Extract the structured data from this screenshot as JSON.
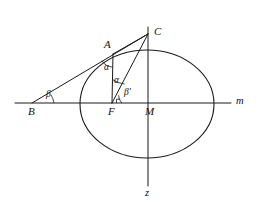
{
  "figure": {
    "width": 256,
    "height": 203,
    "background_color": "#ffffff",
    "stroke_color": "#1a1a1a"
  },
  "axes": [
    {
      "key": "m",
      "label": "m",
      "orientation": "horizontal",
      "label_x": 236,
      "label_y": 96,
      "x1": 15,
      "y1": 103,
      "x2": 231,
      "y2": 103
    },
    {
      "key": "z",
      "label": "z",
      "orientation": "vertical",
      "label_x": 145,
      "label_y": 188,
      "x1": 148,
      "y1": 27,
      "x2": 148,
      "y2": 186
    }
  ],
  "ellipse": {
    "name": "main-ellipse",
    "cx": 147,
    "cy": 104,
    "rx": 67,
    "ry": 54
  },
  "points": [
    {
      "key": "B",
      "label": "B",
      "x": 32,
      "y": 103,
      "label_x": 28,
      "label_y": 106
    },
    {
      "key": "F",
      "label": "F",
      "x": 112,
      "y": 103,
      "label_x": 108,
      "label_y": 106
    },
    {
      "key": "M",
      "label": "M",
      "x": 148,
      "y": 103,
      "label_x": 145,
      "label_y": 106
    },
    {
      "key": "A",
      "label": "A",
      "x": 113,
      "y": 54,
      "label_x": 104,
      "label_y": 39
    },
    {
      "key": "C",
      "label": "C",
      "x": 148,
      "y": 34,
      "label_x": 154,
      "label_y": 26
    }
  ],
  "segments": [
    {
      "key": "BC",
      "from": "B",
      "to": "C",
      "x1": 32,
      "y1": 103,
      "x2": 148,
      "y2": 34
    },
    {
      "key": "BF",
      "from": "B",
      "to": "F",
      "x1": 32,
      "y1": 103,
      "x2": 112,
      "y2": 103
    },
    {
      "key": "AC",
      "from": "A",
      "to": "C",
      "x1": 113,
      "y1": 54,
      "x2": 148,
      "y2": 34
    },
    {
      "key": "AF",
      "from": "A",
      "to": "F",
      "x1": 113,
      "y1": 54,
      "x2": 112,
      "y2": 103
    },
    {
      "key": "FC",
      "from": "F",
      "to": "C",
      "x1": 112,
      "y1": 103,
      "x2": 148,
      "y2": 34
    }
  ],
  "angles": [
    {
      "key": "beta",
      "label": "β",
      "at_point": "B",
      "label_x": 46,
      "label_y": 90,
      "arc": "M 54 103 A 22 22 0 0 0 50.9 94.7"
    },
    {
      "key": "alpha_at_A",
      "label": "α",
      "at_point": "A",
      "label_x": 104,
      "label_y": 63,
      "arc": "M 101.9 60.6 A 13 13 0 0 0 112.7 67.0"
    },
    {
      "key": "alpha_at_F",
      "label": "α",
      "at_point": "F",
      "label_x": 114,
      "label_y": 76,
      "arc": "M 112.4 79.5 A 24 24 0 0 0 124.6 84.0"
    },
    {
      "key": "beta_prime",
      "label": "β′",
      "at_point": "F",
      "label_x": 124,
      "label_y": 88,
      "arc": "M 118.6 95.2 A 11 11 0 0 0 121.8 103"
    }
  ],
  "right_angle_mark": {
    "key": "right-angle-at-F",
    "path": "M 116.5 103 L 116.5 99.2 L 120.3 99.2"
  }
}
